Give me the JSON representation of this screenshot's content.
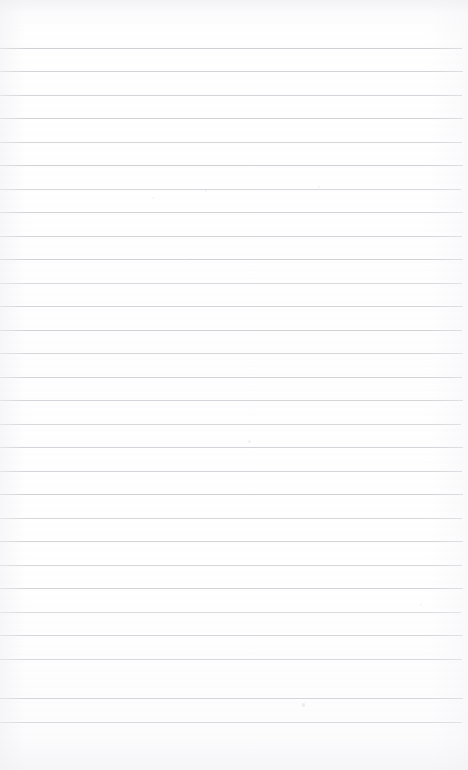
{
  "document": {
    "kind": "scanned-ruled-notepad-page",
    "title": "Blank ruled page",
    "text_content": "",
    "handwriting": "none",
    "printed_text": "none",
    "page_width": 468,
    "page_height": 770,
    "background_color": "#fefefe",
    "paper_tint": "#fbfbfc"
  },
  "ruling": {
    "style": "wide-ruled horizontal lines",
    "line_color": "#c9c9ce",
    "line_thickness_px": 1,
    "line_count": 29,
    "first_line_y": 48,
    "line_pitch_px": 23.4,
    "last_line_y": 722,
    "line_start_x": 0,
    "line_end_x": 463,
    "vertical_margin_rule": "none",
    "top_margin_px": 48,
    "bottom_margin_px": 48,
    "lines": [
      {
        "y": 48,
        "opacity": 0.85,
        "right_x": 462
      },
      {
        "y": 71,
        "opacity": 0.8,
        "right_x": 463
      },
      {
        "y": 95,
        "opacity": 0.78,
        "right_x": 462
      },
      {
        "y": 118,
        "opacity": 0.82,
        "right_x": 463
      },
      {
        "y": 142,
        "opacity": 0.76,
        "right_x": 462
      },
      {
        "y": 165,
        "opacity": 0.84,
        "right_x": 463
      },
      {
        "y": 189,
        "opacity": 0.72,
        "right_x": 461
      },
      {
        "y": 212,
        "opacity": 0.8,
        "right_x": 463
      },
      {
        "y": 236,
        "opacity": 0.78,
        "right_x": 462
      },
      {
        "y": 259,
        "opacity": 0.83,
        "right_x": 463
      },
      {
        "y": 283,
        "opacity": 0.7,
        "right_x": 462
      },
      {
        "y": 306,
        "opacity": 0.79,
        "right_x": 463
      },
      {
        "y": 330,
        "opacity": 0.82,
        "right_x": 462
      },
      {
        "y": 353,
        "opacity": 0.75,
        "right_x": 463
      },
      {
        "y": 377,
        "opacity": 0.81,
        "right_x": 462
      },
      {
        "y": 400,
        "opacity": 0.78,
        "right_x": 463
      },
      {
        "y": 424,
        "opacity": 0.73,
        "right_x": 461
      },
      {
        "y": 447,
        "opacity": 0.8,
        "right_x": 463
      },
      {
        "y": 471,
        "opacity": 0.77,
        "right_x": 462
      },
      {
        "y": 494,
        "opacity": 0.84,
        "right_x": 463
      },
      {
        "y": 518,
        "opacity": 0.71,
        "right_x": 462
      },
      {
        "y": 541,
        "opacity": 0.79,
        "right_x": 463
      },
      {
        "y": 565,
        "opacity": 0.74,
        "right_x": 462
      },
      {
        "y": 588,
        "opacity": 0.8,
        "right_x": 463
      },
      {
        "y": 612,
        "opacity": 0.66,
        "right_x": 461
      },
      {
        "y": 635,
        "opacity": 0.76,
        "right_x": 463
      },
      {
        "y": 659,
        "opacity": 0.72,
        "right_x": 462
      },
      {
        "y": 698,
        "opacity": 0.78,
        "right_x": 463
      },
      {
        "y": 722,
        "opacity": 0.7,
        "right_x": 462
      }
    ]
  },
  "artifacts": {
    "label": "scanner dust specks",
    "specks": [
      {
        "x": 302,
        "y": 703,
        "w": 3,
        "h": 4,
        "opacity": 0.55
      },
      {
        "x": 248,
        "y": 440,
        "w": 3,
        "h": 3,
        "opacity": 0.4
      },
      {
        "x": 205,
        "y": 190,
        "w": 2,
        "h": 2,
        "opacity": 0.3
      },
      {
        "x": 318,
        "y": 186,
        "w": 2,
        "h": 2,
        "opacity": 0.28
      },
      {
        "x": 190,
        "y": 258,
        "w": 2,
        "h": 2,
        "opacity": 0.26
      },
      {
        "x": 420,
        "y": 604,
        "w": 2,
        "h": 2,
        "opacity": 0.3
      },
      {
        "x": 152,
        "y": 197,
        "w": 2,
        "h": 2,
        "opacity": 0.22
      }
    ]
  }
}
